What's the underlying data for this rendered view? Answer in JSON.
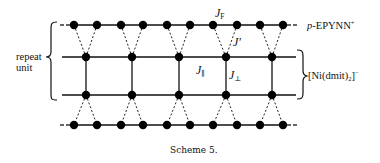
{
  "diagram": {
    "title": "Scheme 5.",
    "left_label": {
      "line1": "repeat",
      "line2": "unit"
    },
    "cation_label": {
      "prefix": "p",
      "name": "-EPYNN",
      "charge": "+"
    },
    "anion_label": {
      "open": "[Ni(dmit)",
      "sub": "2",
      "close": "]",
      "charge": "−"
    },
    "couplings": {
      "J_F": {
        "main": "J",
        "sub": "F"
      },
      "J_prime": {
        "main": "J'"
      },
      "J_par": {
        "main": "J",
        "sub": "∥"
      },
      "J_perp": {
        "main": "J",
        "sub": "⊥"
      }
    },
    "rows": [
      {
        "name": "cation-row-top",
        "y": 25,
        "type": "cation",
        "nodes_x": [
          74,
          97,
          121,
          143,
          167,
          190,
          213,
          237,
          260,
          283
        ]
      },
      {
        "name": "anion-row-upper",
        "y": 57,
        "type": "anion",
        "nodes_x": [
          86,
          132,
          179,
          226,
          272
        ]
      },
      {
        "name": "anion-row-lower",
        "y": 95,
        "type": "anion",
        "nodes_x": [
          86,
          132,
          179,
          226,
          272
        ]
      },
      {
        "name": "cation-row-bottom",
        "y": 125,
        "type": "cation",
        "nodes_x": [
          74,
          97,
          121,
          143,
          167,
          190,
          213,
          237,
          260,
          283
        ]
      }
    ],
    "colors": {
      "ink": "#111111",
      "background": "#ffffff"
    }
  }
}
